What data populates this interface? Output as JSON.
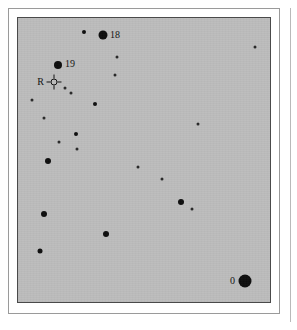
{
  "figure": {
    "type": "star-chart",
    "field_background_color": "#bcbcbc",
    "star_color": "#0d0d0d",
    "frame_color": "#4a4a4a",
    "field": {
      "x": 17,
      "y": 17,
      "width": 254,
      "height": 286
    }
  },
  "chart_data": {
    "type": "scatter",
    "xlabel": "",
    "ylabel": "",
    "xlim": [
      0,
      254
    ],
    "ylim": [
      0,
      286
    ],
    "grid": false,
    "legend": "none",
    "note": "Positions are pixel coordinates within the gray sky field; 'size' is the plotted dot diameter in px, which encodes stellar brightness (larger = brighter).",
    "markers": [
      {
        "id": "s1",
        "x": 66,
        "y": 14,
        "size": 4,
        "label": "",
        "kind": "star"
      },
      {
        "id": "s2",
        "x": 85,
        "y": 17,
        "size": 9,
        "label": "18",
        "kind": "star",
        "label_dx": 7,
        "label_dy": 0,
        "label_anchor": "left"
      },
      {
        "id": "s3",
        "x": 237,
        "y": 29,
        "size": 3,
        "label": "",
        "kind": "star"
      },
      {
        "id": "s4",
        "x": 99,
        "y": 39,
        "size": 3,
        "label": "",
        "kind": "star"
      },
      {
        "id": "s5",
        "x": 40,
        "y": 47,
        "size": 8,
        "label": "19",
        "kind": "star",
        "label_dx": 7,
        "label_dy": -1,
        "label_anchor": "left"
      },
      {
        "id": "s6",
        "x": 97,
        "y": 57,
        "size": 3,
        "label": "",
        "kind": "star"
      },
      {
        "id": "r1",
        "x": 36,
        "y": 64,
        "size": 7,
        "label": "R",
        "kind": "reticle",
        "label_dx": -10,
        "label_dy": 0,
        "label_anchor": "right"
      },
      {
        "id": "s7",
        "x": 47,
        "y": 70,
        "size": 3,
        "label": "",
        "kind": "star"
      },
      {
        "id": "s8",
        "x": 53,
        "y": 75,
        "size": 3,
        "label": "",
        "kind": "star"
      },
      {
        "id": "s9",
        "x": 14,
        "y": 82,
        "size": 3,
        "label": "",
        "kind": "star"
      },
      {
        "id": "s10",
        "x": 77,
        "y": 86,
        "size": 4,
        "label": "",
        "kind": "star"
      },
      {
        "id": "s11",
        "x": 26,
        "y": 100,
        "size": 3,
        "label": "",
        "kind": "star"
      },
      {
        "id": "s12",
        "x": 180,
        "y": 106,
        "size": 3,
        "label": "",
        "kind": "star"
      },
      {
        "id": "s13",
        "x": 58,
        "y": 116,
        "size": 4,
        "label": "",
        "kind": "star"
      },
      {
        "id": "s14",
        "x": 41,
        "y": 124,
        "size": 3,
        "label": "",
        "kind": "star"
      },
      {
        "id": "s15",
        "x": 59,
        "y": 131,
        "size": 3,
        "label": "",
        "kind": "star"
      },
      {
        "id": "s16",
        "x": 30,
        "y": 143,
        "size": 6,
        "label": "",
        "kind": "star"
      },
      {
        "id": "s17",
        "x": 120,
        "y": 149,
        "size": 3,
        "label": "",
        "kind": "star"
      },
      {
        "id": "s18",
        "x": 144,
        "y": 161,
        "size": 3,
        "label": "",
        "kind": "star"
      },
      {
        "id": "s19",
        "x": 163,
        "y": 184,
        "size": 6,
        "label": "",
        "kind": "star"
      },
      {
        "id": "s20",
        "x": 174,
        "y": 191,
        "size": 3,
        "label": "",
        "kind": "star"
      },
      {
        "id": "s21",
        "x": 26,
        "y": 196,
        "size": 6,
        "label": "",
        "kind": "star"
      },
      {
        "id": "s22",
        "x": 88,
        "y": 216,
        "size": 6,
        "label": "",
        "kind": "star"
      },
      {
        "id": "s23",
        "x": 22,
        "y": 233,
        "size": 5,
        "label": "",
        "kind": "star"
      },
      {
        "id": "s24",
        "x": 227,
        "y": 263,
        "size": 13,
        "label": "0",
        "kind": "star",
        "label_dx": -10,
        "label_dy": 0,
        "label_anchor": "right"
      }
    ]
  }
}
